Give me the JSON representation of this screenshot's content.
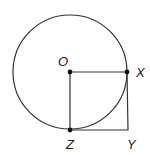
{
  "diagram": {
    "colors": {
      "stroke": "#333333",
      "point": "#111111",
      "label": "#222222",
      "background": "#ffffff"
    },
    "circle": {
      "center_label": "O",
      "cx": 70,
      "cy": 72,
      "r": 57
    },
    "square": {
      "vertices": [
        "O",
        "X",
        "Y",
        "Z"
      ]
    },
    "points": [
      {
        "label": "O",
        "x": 70,
        "y": 72,
        "marked": true
      },
      {
        "label": "X",
        "x": 127,
        "y": 72,
        "marked": true
      },
      {
        "label": "Y",
        "x": 128,
        "y": 130,
        "marked": false
      },
      {
        "label": "Z",
        "x": 70,
        "y": 130,
        "marked": true
      }
    ],
    "labels": {
      "O": "O",
      "X": "X",
      "Y": "Y",
      "Z": "Z"
    }
  }
}
